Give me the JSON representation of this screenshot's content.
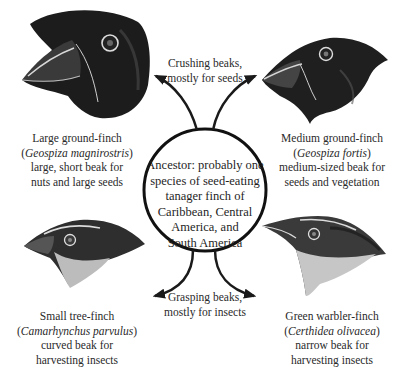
{
  "diagram": {
    "ancestor": {
      "text": "Ancestor: probably one species of seed-eating tanager finch of Caribbean, Central America, and South America",
      "lines": [
        "Ancestor: probably one",
        "species of seed-eating",
        "tanager finch of",
        "Caribbean, Central",
        "America, and",
        "South America"
      ]
    },
    "branches": {
      "top": {
        "line1": "Crushing beaks,",
        "line2": "mostly for seeds"
      },
      "bottom": {
        "line1": "Grasping beaks,",
        "line2": "mostly for insects"
      }
    },
    "finches": [
      {
        "position": "top-left",
        "common_name": "Large ground-finch",
        "scientific_name": "Geospiza magnirostris",
        "description_line1": "large, short beak for",
        "description_line2": "nuts and large seeds"
      },
      {
        "position": "top-right",
        "common_name": "Medium ground-finch",
        "scientific_name": "Geospiza fortis",
        "description_line1": "medium-sized beak for",
        "description_line2": "seeds and vegetation"
      },
      {
        "position": "bottom-left",
        "common_name": "Small tree-finch",
        "scientific_name": "Camarhynchus parvulus",
        "description_line1": "curved beak for",
        "description_line2": "harvesting insects"
      },
      {
        "position": "bottom-right",
        "common_name": "Green warbler-finch",
        "scientific_name": "Certhidea olivacea",
        "description_line1": "narrow beak for",
        "description_line2": "harvesting insects"
      }
    ],
    "colors": {
      "ink": "#1a1a1a",
      "text": "#2a2a2a",
      "background": "#ffffff"
    }
  }
}
